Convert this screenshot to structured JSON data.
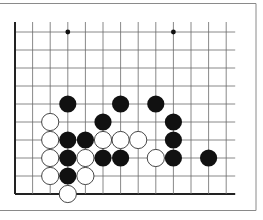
{
  "diagram": {
    "type": "go-board-partial",
    "colors": {
      "background": "#ffffff",
      "frame": "#8a8a8a",
      "grid": "#6a6a6a",
      "edge": "#222222",
      "black_stone": "#111111",
      "white_stone": "#ffffff",
      "white_stone_outline": "#333333"
    },
    "grid": {
      "columns": 13,
      "rows": 10,
      "origin_x": 15,
      "origin_y": 32,
      "col_spacing": 17.6,
      "row_spacing": 18,
      "left_edge_is_board_edge": true,
      "bottom_edge_is_board_edge": true
    },
    "hoshi": [
      {
        "col": 3,
        "row": 0
      },
      {
        "col": 9,
        "row": 0
      }
    ],
    "stones": [
      {
        "color": "black",
        "col": 3,
        "row": 4
      },
      {
        "color": "black",
        "col": 6,
        "row": 4
      },
      {
        "color": "black",
        "col": 8,
        "row": 4
      },
      {
        "color": "white",
        "col": 2,
        "row": 5
      },
      {
        "color": "black",
        "col": 5,
        "row": 5
      },
      {
        "color": "black",
        "col": 9,
        "row": 5
      },
      {
        "color": "white",
        "col": 2,
        "row": 6
      },
      {
        "color": "black",
        "col": 3,
        "row": 6
      },
      {
        "color": "black",
        "col": 4,
        "row": 6
      },
      {
        "color": "white",
        "col": 5,
        "row": 6
      },
      {
        "color": "white",
        "col": 6,
        "row": 6
      },
      {
        "color": "white",
        "col": 7,
        "row": 6
      },
      {
        "color": "black",
        "col": 9,
        "row": 6
      },
      {
        "color": "white",
        "col": 2,
        "row": 7
      },
      {
        "color": "black",
        "col": 3,
        "row": 7
      },
      {
        "color": "white",
        "col": 4,
        "row": 7
      },
      {
        "color": "black",
        "col": 5,
        "row": 7
      },
      {
        "color": "black",
        "col": 6,
        "row": 7
      },
      {
        "color": "white",
        "col": 8,
        "row": 7
      },
      {
        "color": "black",
        "col": 9,
        "row": 7
      },
      {
        "color": "black",
        "col": 11,
        "row": 7
      },
      {
        "color": "white",
        "col": 2,
        "row": 8
      },
      {
        "color": "black",
        "col": 3,
        "row": 8
      },
      {
        "color": "white",
        "col": 4,
        "row": 8
      },
      {
        "color": "white",
        "col": 3,
        "row": 9
      }
    ]
  }
}
